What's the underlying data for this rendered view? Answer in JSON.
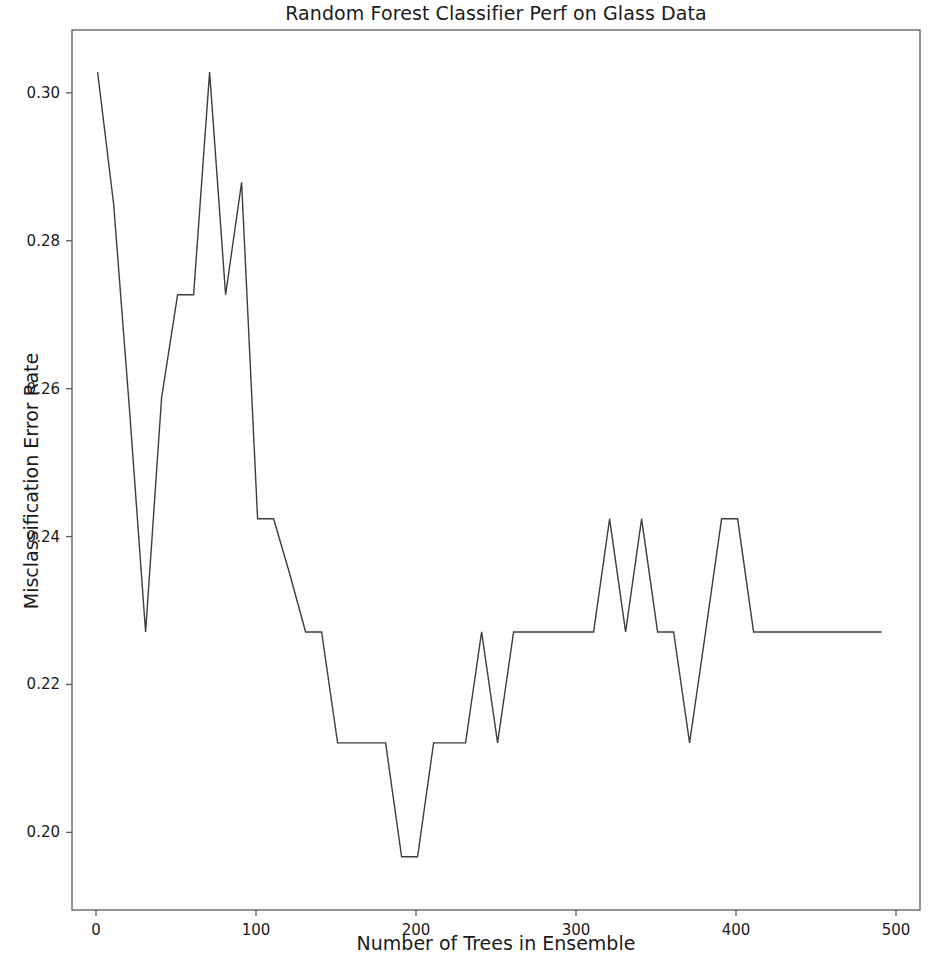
{
  "chart_data": {
    "type": "line",
    "title": "Random Forest Classifier Perf on Glass Data",
    "xlabel": "Number of Trees in Ensemble",
    "ylabel": "Misclassification Error Rate",
    "xlim": [
      -15,
      515
    ],
    "ylim": [
      0.1895,
      0.3085
    ],
    "xticks": [
      0,
      100,
      200,
      300,
      400,
      500
    ],
    "xticklabels": [
      "0",
      "100",
      "200",
      "300",
      "400",
      "500"
    ],
    "yticks": [
      0.2,
      0.22,
      0.24,
      0.26,
      0.28,
      0.3
    ],
    "yticklabels": [
      "0.20",
      "0.22",
      "0.24",
      "0.26",
      "0.28",
      "0.30"
    ],
    "grid": false,
    "legend": null,
    "line_color": "#3d3d3d",
    "line_width": 1.4,
    "series": [
      {
        "name": "Misclassification Error Rate",
        "x": [
          1,
          11,
          21,
          31,
          41,
          51,
          61,
          71,
          81,
          91,
          101,
          111,
          121,
          131,
          141,
          151,
          161,
          171,
          181,
          191,
          201,
          211,
          221,
          231,
          241,
          251,
          261,
          271,
          281,
          291,
          301,
          311,
          321,
          331,
          341,
          351,
          361,
          371,
          381,
          391,
          401,
          411,
          421,
          431,
          441,
          451,
          461,
          471,
          481,
          491
        ],
        "values": [
          0.3028,
          0.285,
          0.257,
          0.2271,
          0.2588,
          0.2727,
          0.2727,
          0.3028,
          0.2727,
          0.2879,
          0.2424,
          0.2424,
          0.235,
          0.2271,
          0.2271,
          0.2121,
          0.2121,
          0.2121,
          0.2121,
          0.1967,
          0.1967,
          0.2121,
          0.2121,
          0.2121,
          0.2271,
          0.2121,
          0.2271,
          0.2271,
          0.2271,
          0.2271,
          0.2271,
          0.2271,
          0.2424,
          0.2271,
          0.2424,
          0.2271,
          0.2271,
          0.2121,
          0.2271,
          0.2424,
          0.2424,
          0.2271,
          0.2271,
          0.2271,
          0.2271,
          0.2271,
          0.2271,
          0.2271,
          0.2271,
          0.2271
        ]
      }
    ]
  },
  "axes": {
    "spine_color": "#5a5a5a",
    "background": "#ffffff"
  }
}
